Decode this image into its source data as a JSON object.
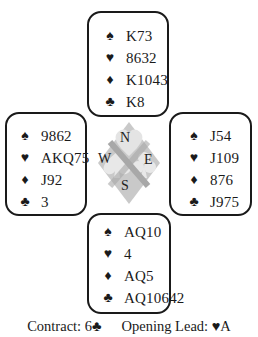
{
  "hands": {
    "north": {
      "spades": "K73",
      "hearts": "8632",
      "diamonds": "K1043",
      "clubs": "K8"
    },
    "west": {
      "spades": "9862",
      "hearts": "AKQ75",
      "diamonds": "J92",
      "clubs": "3"
    },
    "east": {
      "spades": "J54",
      "hearts": "J109",
      "diamonds": "876",
      "clubs": "J975"
    },
    "south": {
      "spades": "AQ10",
      "hearts": "4",
      "diamonds": "AQ5",
      "clubs": "AQ10642"
    }
  },
  "suit_symbols": {
    "spades": "♠",
    "hearts": "♥",
    "diamonds": "♦",
    "clubs": "♣"
  },
  "compass": {
    "north": "N",
    "west": "W",
    "east": "E",
    "south": "S"
  },
  "footer": {
    "contract_label": "Contract: 6",
    "contract_suit": "♣",
    "lead_label": "Opening Lead: ",
    "lead_suit": "♥",
    "lead_card": "A"
  }
}
